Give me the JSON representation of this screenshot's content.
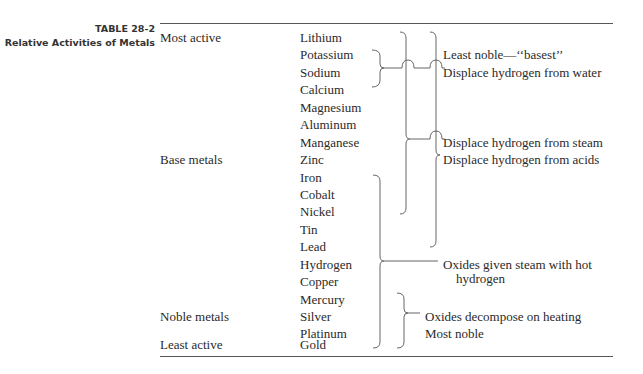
{
  "table": {
    "number": "TABLE 28-2",
    "title": "Relative Activities of Metals",
    "categories": [
      {
        "label": "Most active",
        "row": 0
      },
      {
        "label": "Base metals",
        "row": 7
      },
      {
        "label": "Noble metals",
        "row": 16
      },
      {
        "label": "Least active",
        "row": 18
      }
    ],
    "metals": [
      "Lithium",
      "Potassium",
      "Sodium",
      "Calcium",
      "Magnesium",
      "Aluminum",
      "Manganese",
      "Zinc",
      "Iron",
      "Cobalt",
      "Nickel",
      "Tin",
      "Lead",
      "Hydrogen",
      "Copper",
      "Mercury",
      "Silver",
      "Platinum",
      "Gold"
    ],
    "annotations": {
      "least_noble": "Least noble—‘‘basest’’",
      "water": "Displace hydrogen from water",
      "steam": "Displace hydrogen from steam",
      "acids": "Displace hydrogen from acids",
      "hot_hydrogen_line1": "Oxides given steam with hot",
      "hot_hydrogen_line2": "hydrogen",
      "decompose": "Oxides decompose on heating",
      "most_noble": "Most noble"
    }
  }
}
